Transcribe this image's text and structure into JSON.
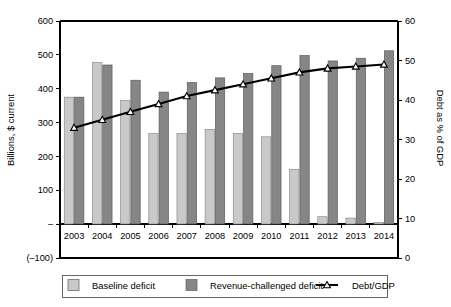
{
  "chart_data": {
    "type": "bar",
    "title": "",
    "subtitle": "",
    "categories": [
      "2003",
      "2004",
      "2005",
      "2006",
      "2007",
      "2008",
      "2009",
      "2010",
      "2011",
      "2012",
      "2013",
      "2014"
    ],
    "xlabel": "",
    "ylabel": "Billions, $ current",
    "y2label": "Debt as % of GDP",
    "ylim": [
      -100,
      600
    ],
    "y2lim": [
      0,
      60
    ],
    "yticks": [
      600,
      500,
      400,
      300,
      200,
      100,
      0,
      -100
    ],
    "ytick_labels": [
      "600",
      "500",
      "400",
      "300",
      "200",
      "100",
      "–",
      "(–100)"
    ],
    "y2ticks": [
      60,
      50,
      40,
      30,
      20,
      10,
      0
    ],
    "y2tick_labels": [
      "60",
      "50",
      "40",
      "30",
      "20",
      "10",
      "0"
    ],
    "grid": false,
    "legend_position": "bottom",
    "series": [
      {
        "name": "Baseline deficit",
        "axis": "left",
        "kind": "bar",
        "color": "#c9c9c9",
        "values": [
          375,
          478,
          365,
          268,
          268,
          280,
          268,
          258,
          162,
          22,
          18,
          5
        ]
      },
      {
        "name": "Revenue-challenged deficit",
        "axis": "left",
        "kind": "bar",
        "color": "#868686",
        "values": [
          375,
          470,
          425,
          390,
          418,
          432,
          445,
          468,
          498,
          482,
          490,
          512
        ]
      },
      {
        "name": "Debt/GDP",
        "axis": "right",
        "kind": "line",
        "color": "#000000",
        "marker": "triangle-open",
        "values": [
          33.0,
          35.0,
          37.0,
          39.0,
          41.0,
          42.5,
          44.0,
          45.5,
          47.0,
          48.0,
          48.5,
          49.0
        ]
      }
    ]
  },
  "legend": {
    "items": [
      {
        "label": "Baseline deficit",
        "swatch": "#c9c9c9",
        "type": "box"
      },
      {
        "label": "Revenue-challenged deficit",
        "swatch": "#868686",
        "type": "box"
      },
      {
        "label": "Debt/GDP",
        "swatch": "#000000",
        "type": "line-marker"
      }
    ]
  },
  "axes": {
    "left_title": "Billions, $ current",
    "right_title": "Debt as % of GDP"
  }
}
